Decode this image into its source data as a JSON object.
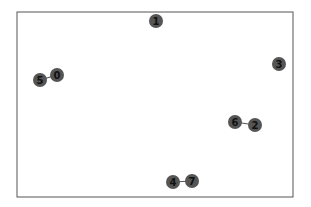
{
  "diagram": {
    "type": "network-graph",
    "frame": {
      "x": 17,
      "y": 12,
      "width": 276,
      "height": 185,
      "stroke": "#555555"
    },
    "node_color": "#555555",
    "label_color": "#111111",
    "node_radius": 7,
    "nodes": [
      {
        "id": "0",
        "label": "0",
        "x": 57,
        "y": 75
      },
      {
        "id": "1",
        "label": "1",
        "x": 156,
        "y": 21
      },
      {
        "id": "2",
        "label": "2",
        "x": 255,
        "y": 125
      },
      {
        "id": "3",
        "label": "3",
        "x": 279,
        "y": 64
      },
      {
        "id": "4",
        "label": "4",
        "x": 173,
        "y": 182
      },
      {
        "id": "5",
        "label": "5",
        "x": 40,
        "y": 80
      },
      {
        "id": "6",
        "label": "6",
        "x": 235,
        "y": 122
      },
      {
        "id": "7",
        "label": "7",
        "x": 192,
        "y": 181
      }
    ],
    "edges": [
      {
        "source": "5",
        "target": "0"
      },
      {
        "source": "6",
        "target": "2"
      },
      {
        "source": "4",
        "target": "7"
      }
    ]
  }
}
